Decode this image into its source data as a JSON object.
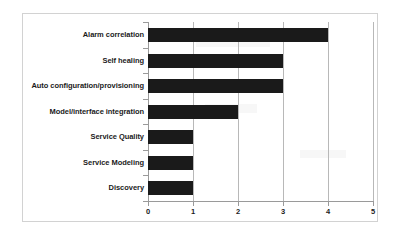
{
  "chart_data": {
    "type": "bar",
    "orientation": "horizontal",
    "title": "",
    "xlabel": "",
    "ylabel": "",
    "categories": [
      "Alarm correlation",
      "Self healing",
      "Auto configuration/provisioning",
      "Model/interface integration",
      "Service Quality",
      "Service Modeling",
      "Discovery"
    ],
    "values": [
      4,
      3,
      3,
      2,
      1,
      1,
      1
    ],
    "xlim": [
      0,
      5
    ],
    "xticks": [
      0,
      1,
      2,
      3,
      4,
      5
    ],
    "xtick_labels": [
      "0",
      "1",
      "2",
      "3",
      "4",
      "5"
    ],
    "grid": "vertical",
    "legend": "none",
    "bar_color": "#1a1a1a",
    "gridline_color": "#b8b8b8",
    "axis_color": "#9a9a9a",
    "frame_color": "#d2d2d2",
    "background_color": "#ffffff"
  }
}
